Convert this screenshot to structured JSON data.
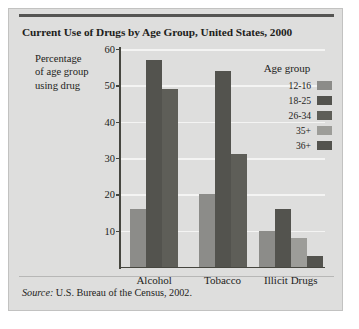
{
  "figure": {
    "title": "Current Use of Drugs by Age Group, United States, 2000",
    "source_word": "Source:",
    "source_text": " U.S. Bureau of the Census, 2002.",
    "panel_color": "#dededd",
    "rule_color": "#555553"
  },
  "axis": {
    "y_title_line1": "Percentage",
    "y_title_line2": "of age group",
    "y_title_line3": "using drug"
  },
  "legend": {
    "title": "Age group"
  },
  "chart_data": {
    "type": "bar",
    "title": "Current Use of Drugs by Age Group, United States, 2000",
    "xlabel": "",
    "ylabel": "Percentage of age group using drug",
    "ylim": [
      0,
      60
    ],
    "yticks": [
      10,
      20,
      30,
      40,
      50,
      60
    ],
    "grid": true,
    "legend_position": "right",
    "categories": [
      "Alcohol",
      "Tobacco",
      "Illicit Drugs"
    ],
    "series": [
      {
        "name": "12-16",
        "color": "#8c8c89",
        "values": [
          16,
          20,
          10
        ]
      },
      {
        "name": "18-25",
        "color": "#53534e",
        "values": [
          57,
          54,
          16
        ]
      },
      {
        "name": "26-34",
        "color": "#5e5e58",
        "values": [
          49,
          31,
          null
        ]
      },
      {
        "name": "35+",
        "color": "#9d9d99",
        "values": [
          null,
          null,
          8
        ]
      },
      {
        "name": "36+",
        "color": "#53534e",
        "values": [
          null,
          null,
          3
        ]
      }
    ],
    "source": "Source: U.S. Bureau of the Census, 2002."
  }
}
